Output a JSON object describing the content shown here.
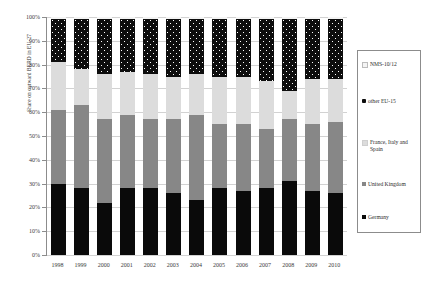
{
  "chart_data": {
    "type": "bar",
    "stacked": true,
    "normalized": "100%",
    "title": "",
    "xlabel": "",
    "ylabel": "Share on outward BERD in EU-27",
    "ylim": [
      0,
      100
    ],
    "yticks": [
      "0%",
      "10%",
      "20%",
      "30%",
      "40%",
      "50%",
      "60%",
      "70%",
      "80%",
      "90%",
      "100%"
    ],
    "ytick_values": [
      0,
      10,
      20,
      30,
      40,
      50,
      60,
      70,
      80,
      90,
      100
    ],
    "grid": true,
    "legend_position": "right",
    "categories": [
      "1998",
      "1999",
      "2000",
      "2001",
      "2002",
      "2003",
      "2004",
      "2005",
      "2006",
      "2007",
      "2008",
      "2009",
      "2010"
    ],
    "series": [
      {
        "name": "Germany",
        "color": "#0a0a0a",
        "values": [
          30,
          28,
          22,
          28,
          28,
          26,
          23,
          28,
          27,
          28,
          31,
          27,
          26
        ]
      },
      {
        "name": "United Kingdom",
        "color": "#878787",
        "values": [
          31,
          35,
          35,
          31,
          29,
          31,
          36,
          27,
          28,
          25,
          26,
          28,
          30
        ]
      },
      {
        "name": "France, Italy and Spain",
        "color": "#dcdcdc",
        "values": [
          20,
          15,
          19,
          18,
          19,
          18,
          17,
          20,
          20,
          20,
          12,
          19,
          18
        ]
      },
      {
        "name": "other EU-15",
        "color": "#0d0d0d",
        "values": [
          18,
          21,
          23,
          22,
          23,
          24,
          23,
          24,
          24,
          26,
          30,
          25,
          25
        ]
      },
      {
        "name": "NMS-10/12",
        "color": "#f4f4f4",
        "values": [
          1,
          1,
          1,
          1,
          1,
          1,
          1,
          1,
          1,
          1,
          1,
          1,
          1
        ]
      }
    ],
    "cumulative_tops": {
      "germany": [
        30,
        28,
        22,
        28,
        28,
        26,
        23,
        28,
        27,
        28,
        31,
        27,
        26
      ],
      "united_kingdom": [
        61,
        63,
        57,
        59,
        57,
        57,
        59,
        55,
        55,
        53,
        57,
        55,
        56
      ],
      "france_italy_spain": [
        81,
        78,
        76,
        77,
        76,
        75,
        76,
        75,
        75,
        73,
        69,
        74,
        74
      ],
      "other_eu15": [
        99,
        99,
        99,
        99,
        99,
        99,
        99,
        99,
        99,
        99,
        99,
        99,
        99
      ]
    }
  },
  "legend": {
    "items": [
      {
        "label": "NMS-10/12",
        "swatch": "sw-nms"
      },
      {
        "label": "other EU-15",
        "swatch": "sw-other"
      },
      {
        "label": "France, Italy and Spain",
        "swatch": "sw-fis"
      },
      {
        "label": "United Kingdom",
        "swatch": "sw-uk"
      },
      {
        "label": "Germany",
        "swatch": "sw-germany"
      }
    ]
  }
}
